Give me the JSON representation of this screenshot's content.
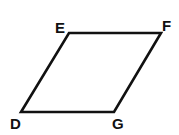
{
  "diagram": {
    "shape": "parallelogram",
    "vertices": [
      {
        "label": "E",
        "x": 69,
        "y": 33,
        "label_x": 55,
        "label_y": 33
      },
      {
        "label": "F",
        "x": 161,
        "y": 33,
        "label_x": 162,
        "label_y": 31
      },
      {
        "label": "G",
        "x": 114,
        "y": 112,
        "label_x": 112,
        "label_y": 129
      },
      {
        "label": "D",
        "x": 21,
        "y": 112,
        "label_x": 10,
        "label_y": 129
      }
    ],
    "stroke_color": "#111111",
    "background": "#ffffff"
  }
}
